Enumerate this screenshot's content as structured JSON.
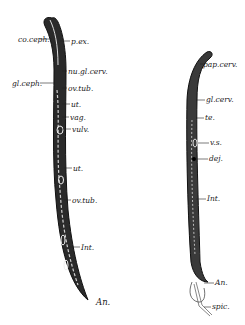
{
  "figure": {
    "female_labels": [
      {
        "id": "co-ceph",
        "text": "co.ceph.",
        "x": 18,
        "y": 36
      },
      {
        "id": "p-ex",
        "text": "p.ex.",
        "x": 71,
        "y": 38
      },
      {
        "id": "nu-gl-cerv",
        "text": "nu.gl.cerv.",
        "x": 68,
        "y": 68
      },
      {
        "id": "gl-ceph",
        "text": "gl.ceph.",
        "x": 14,
        "y": 80
      },
      {
        "id": "ov-tub-1",
        "text": "ov.tub.",
        "x": 68,
        "y": 85
      },
      {
        "id": "ut-1",
        "text": "ut.",
        "x": 71,
        "y": 101
      },
      {
        "id": "vag",
        "text": "vag.",
        "x": 70,
        "y": 114
      },
      {
        "id": "vulv",
        "text": "vulv.",
        "x": 72,
        "y": 126
      },
      {
        "id": "ut-2",
        "text": "ut.",
        "x": 73,
        "y": 165
      },
      {
        "id": "ov-tub-2",
        "text": "ov.tub.",
        "x": 72,
        "y": 197
      },
      {
        "id": "int-f",
        "text": "Int.",
        "x": 81,
        "y": 244
      },
      {
        "id": "an-f",
        "text": "An.",
        "x": 96,
        "y": 298
      }
    ],
    "male_labels": [
      {
        "id": "pap-cerv",
        "text": "pap.cerv.",
        "x": 203,
        "y": 62
      },
      {
        "id": "gl-cerv",
        "text": "gl.cerv.",
        "x": 206,
        "y": 97
      },
      {
        "id": "te",
        "text": "te.",
        "x": 205,
        "y": 115
      },
      {
        "id": "vs",
        "text": "v.s.",
        "x": 210,
        "y": 140
      },
      {
        "id": "dej",
        "text": "dej.",
        "x": 209,
        "y": 156
      },
      {
        "id": "int-m",
        "text": "Int.",
        "x": 207,
        "y": 196
      },
      {
        "id": "an-m",
        "text": "An.",
        "x": 215,
        "y": 280
      },
      {
        "id": "spic",
        "text": "spic.",
        "x": 212,
        "y": 305
      }
    ]
  }
}
